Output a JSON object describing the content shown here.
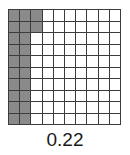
{
  "figure": {
    "caption": "0.22"
  },
  "grid": {
    "columns": 10,
    "rows": 10,
    "total_cells": 100,
    "shaded_cells": 22,
    "unshaded_cells": 78,
    "shaded_color": "#8a8a8a",
    "unshaded_color": "#ffffff",
    "line_color": "#3c3c3c",
    "fill_order": "column-major-left-to-right",
    "shaded_description": "Columns 1 and 2 fully shaded (20 cells) plus column 3 rows 1-2 shaded (2 cells)"
  },
  "chart_data": {
    "type": "heatmap",
    "title": "0.22",
    "xlabel": "",
    "ylabel": "",
    "categories": [
      "c1",
      "c2",
      "c3",
      "c4",
      "c5",
      "c6",
      "c7",
      "c8",
      "c9",
      "c10"
    ],
    "rows": [
      "r1",
      "r2",
      "r3",
      "r4",
      "r5",
      "r6",
      "r7",
      "r8",
      "r9",
      "r10"
    ],
    "value_shaded": 1,
    "value_unshaded": 0,
    "fraction_shaded": 0.22,
    "legend": [],
    "grid": true,
    "values": [
      [
        1,
        1,
        1,
        0,
        0,
        0,
        0,
        0,
        0,
        0
      ],
      [
        1,
        1,
        1,
        0,
        0,
        0,
        0,
        0,
        0,
        0
      ],
      [
        1,
        1,
        0,
        0,
        0,
        0,
        0,
        0,
        0,
        0
      ],
      [
        1,
        1,
        0,
        0,
        0,
        0,
        0,
        0,
        0,
        0
      ],
      [
        1,
        1,
        0,
        0,
        0,
        0,
        0,
        0,
        0,
        0
      ],
      [
        1,
        1,
        0,
        0,
        0,
        0,
        0,
        0,
        0,
        0
      ],
      [
        1,
        1,
        0,
        0,
        0,
        0,
        0,
        0,
        0,
        0
      ],
      [
        1,
        1,
        0,
        0,
        0,
        0,
        0,
        0,
        0,
        0
      ],
      [
        1,
        1,
        0,
        0,
        0,
        0,
        0,
        0,
        0,
        0
      ],
      [
        1,
        1,
        0,
        0,
        0,
        0,
        0,
        0,
        0,
        0
      ]
    ]
  }
}
